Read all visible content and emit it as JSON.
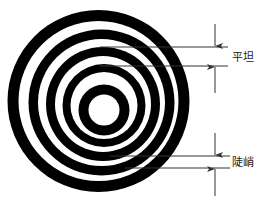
{
  "figure": {
    "type": "concentric-rings-diagram",
    "colors": {
      "ring": "#000000",
      "background": "#ffffff",
      "annotation": "#333333"
    },
    "rings": [
      {
        "cx": 98.5,
        "cy": 101,
        "r_outer": 91,
        "r_inner": 80
      },
      {
        "cx": 101.5,
        "cy": 102.5,
        "r_outer": 73,
        "r_inner": 63.5
      },
      {
        "cx": 103,
        "cy": 104,
        "r_outer": 57,
        "r_inner": 48
      },
      {
        "cx": 104,
        "cy": 105.5,
        "r_outer": 41.5,
        "r_inner": 33.5
      },
      {
        "cx": 104,
        "cy": 110,
        "r_outer": 25.5,
        "r_inner": 15.5
      }
    ],
    "annotations": [
      {
        "id": "flat",
        "label": "平坦",
        "line_top_y": 47,
        "line_bottom_y": 66,
        "line_top_x1": 100,
        "line_bottom_x1": 100,
        "line_x2": 228,
        "arrow_x": 215,
        "arrow_top_start_y": 24,
        "arrow_bottom_end_y": 93,
        "label_x": 232,
        "label_y": 61
      },
      {
        "id": "steep",
        "label": "陡峭",
        "line_top_y": 156,
        "line_bottom_y": 168,
        "line_top_x1": 110,
        "line_bottom_x1": 125,
        "line_x2": 230,
        "arrow_x": 215,
        "arrow_top_start_y": 133,
        "arrow_bottom_end_y": 196,
        "label_x": 232,
        "label_y": 166
      }
    ]
  }
}
